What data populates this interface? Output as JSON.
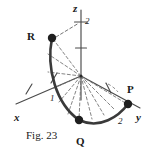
{
  "figure": {
    "caption": "Fig. 23",
    "background_color": "#ffffff",
    "ink_color": "#3a3a3a",
    "label_color": "#1a1a1a",
    "points": [
      {
        "id": "R",
        "label": "R",
        "label_x": 27,
        "label_y": 31,
        "dot_x": 52,
        "dot_y": 38,
        "dot_r": 4.2
      },
      {
        "id": "P",
        "label": "P",
        "label_x": 127,
        "label_y": 84,
        "dot_x": 128,
        "dot_y": 104,
        "dot_r": 4.2
      },
      {
        "id": "Q",
        "label": "Q",
        "label_x": 76,
        "label_y": 136,
        "dot_x": 79,
        "dot_y": 120,
        "dot_r": 4.2
      }
    ],
    "axes": [
      {
        "id": "z",
        "label": "z",
        "label_x": 73,
        "label_y": 3
      },
      {
        "id": "y",
        "label": "y",
        "label_x": 136,
        "label_y": 112
      },
      {
        "id": "x",
        "label": "x",
        "label_x": 14,
        "label_y": 112
      }
    ],
    "ticks": [
      {
        "id": "z-tick-2",
        "label": "2",
        "label_x": 85,
        "label_y": 17,
        "axis": "z",
        "value": 2
      },
      {
        "id": "z-tick-1",
        "label": "",
        "axis": "z",
        "value": 1
      },
      {
        "id": "x-tick-1",
        "label": "1",
        "label_x": 50,
        "label_y": 94,
        "axis": "x",
        "value": 1
      },
      {
        "id": "y-tick-2",
        "label": "2",
        "label_x": 118,
        "label_y": 117,
        "axis": "y",
        "value": 2
      }
    ],
    "geometry_description": "spherical-surface-patch-with-radial-fan"
  }
}
